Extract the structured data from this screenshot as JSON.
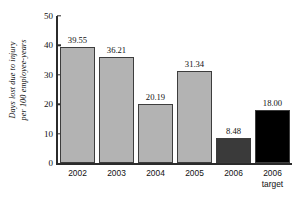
{
  "chart_data": {
    "type": "bar",
    "title": "",
    "xlabel": "",
    "ylabel": "Days lost due to injury per 100 employee-years",
    "ylabel_lines": [
      "Days lost due to injury",
      "per 100 employee-years"
    ],
    "categories": [
      "2002",
      "2003",
      "2004",
      "2005",
      "2006",
      "2006 target"
    ],
    "category_lines": [
      [
        "2002"
      ],
      [
        "2003"
      ],
      [
        "2004"
      ],
      [
        "2005"
      ],
      [
        "2006"
      ],
      [
        "2006",
        "target"
      ]
    ],
    "values": [
      39.55,
      36.21,
      20.19,
      31.34,
      8.48,
      18.0
    ],
    "value_labels": [
      "39.55",
      "36.21",
      "20.19",
      "31.34",
      "8.48",
      "18.00"
    ],
    "bar_colors": [
      "#b3b3b3",
      "#b3b3b3",
      "#b3b3b3",
      "#b3b3b3",
      "#3a3a3a",
      "#000000"
    ],
    "ylim": [
      0,
      50
    ],
    "yticks": [
      0,
      10,
      20,
      30,
      40,
      50
    ],
    "ytick_labels": [
      "0",
      "10",
      "20",
      "30",
      "40",
      "50"
    ],
    "grid": false,
    "legend": "none",
    "axis_color": "#2b2b2b",
    "background": "#ffffff"
  }
}
